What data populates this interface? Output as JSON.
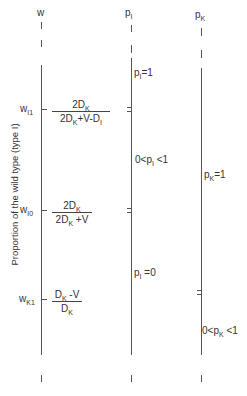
{
  "axes": {
    "w": {
      "label": "w"
    },
    "pI": {
      "label": "p",
      "sub": "I"
    },
    "pK": {
      "label": "p",
      "sub": "K"
    }
  },
  "ylabel": "Proportion of the wild type (type I)",
  "thresholds": [
    {
      "name": "w",
      "sub": "I1",
      "num": "2D_K",
      "den": "2D_K+V-D_I"
    },
    {
      "name": "w",
      "sub": "I0",
      "num": "2D_K",
      "den": "2D_K+V"
    },
    {
      "name": "w",
      "sub": "K1",
      "num": "D_K-V",
      "den": "D_K"
    }
  ],
  "regions": {
    "pI_eq1": {
      "pre": "p",
      "sub": "I",
      "post": "=1"
    },
    "pI_between": {
      "pre": "0<p",
      "sub": "I",
      "post": " <1"
    },
    "pI_eq0": {
      "pre": "p",
      "sub": "I",
      "post": " =0"
    },
    "pK_eq1": {
      "pre": "p",
      "sub": "K",
      "post": "=1"
    },
    "pK_between": {
      "pre": "0<p",
      "sub": "K",
      "post": " <1"
    }
  },
  "glyphs": {
    "D": "D",
    "K": "K",
    "I": "I",
    "two": "2",
    "plusV": "+V",
    "minusDI": "-D",
    "minusV": " -V"
  }
}
